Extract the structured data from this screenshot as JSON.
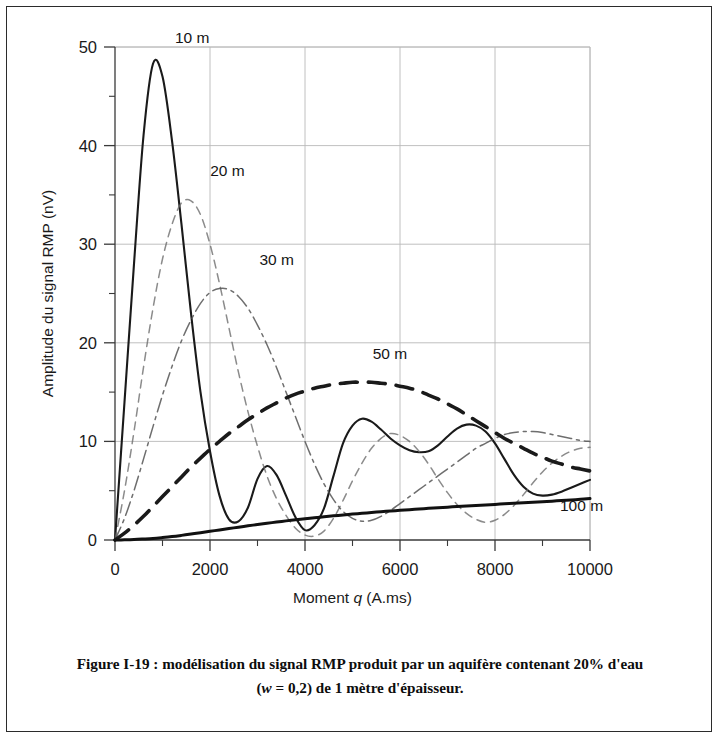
{
  "figure": {
    "caption_line1": "Figure I-19 : modélisation du signal RMP produit par un aquifère contenant 20% d'eau",
    "caption_line2_pre": "(",
    "caption_line2_ital": "w",
    "caption_line2_post": " = 0,2) de 1 mètre d'épaisseur."
  },
  "chart_data": {
    "type": "line",
    "title": "",
    "xlabel_pre": "Moment ",
    "xlabel_ital": "q",
    "xlabel_post": " (A.ms)",
    "xlabel": "Moment q (A.ms)",
    "ylabel": "Amplitude du signal RMP (nV)",
    "xlim": [
      0,
      10000
    ],
    "ylim": [
      0,
      50
    ],
    "grid": true,
    "legend_position": "inline-annotations",
    "x_ticks": [
      0,
      2000,
      4000,
      6000,
      8000,
      10000
    ],
    "x_tick_labels": [
      "0",
      "2000",
      "4000",
      "6000",
      "8000",
      "10000"
    ],
    "x_minor_step": 1000,
    "y_ticks": [
      0,
      10,
      20,
      30,
      40,
      50
    ],
    "y_tick_labels": [
      "0",
      "10",
      "20",
      "30",
      "40",
      "50"
    ],
    "y_minor_step": 5,
    "x": [
      0,
      200,
      400,
      600,
      800,
      1000,
      1200,
      1400,
      1600,
      1800,
      2000,
      2200,
      2400,
      2600,
      2800,
      3000,
      3200,
      3400,
      3600,
      3800,
      4000,
      4200,
      4400,
      4600,
      4800,
      5000,
      5200,
      5400,
      5600,
      5800,
      6000,
      6200,
      6400,
      6600,
      6800,
      7000,
      7200,
      7400,
      7600,
      7800,
      8000,
      8200,
      8400,
      8600,
      8800,
      9000,
      9200,
      9400,
      9600,
      9800,
      10000
    ],
    "series": [
      {
        "name": "10 m",
        "label": "10 m",
        "style": "solid-thin",
        "color": "#1a1a1a",
        "values": [
          0.0,
          14.0,
          28.0,
          41.0,
          48.3,
          47.0,
          40.5,
          32.0,
          23.0,
          15.0,
          9.0,
          4.5,
          2.1,
          1.9,
          3.3,
          6.2,
          7.5,
          6.6,
          4.5,
          2.3,
          1.0,
          1.5,
          3.2,
          6.5,
          9.8,
          11.6,
          12.3,
          12.0,
          11.2,
          10.3,
          9.6,
          9.1,
          8.9,
          9.0,
          9.6,
          10.5,
          11.3,
          11.7,
          11.6,
          11.0,
          9.8,
          8.2,
          6.6,
          5.4,
          4.7,
          4.5,
          4.6,
          4.9,
          5.3,
          5.7,
          6.1
        ]
      },
      {
        "name": "20 m",
        "label": "20 m",
        "style": "dashed-light",
        "color": "#6a6a6a",
        "values": [
          0.0,
          5.0,
          11.0,
          17.5,
          23.5,
          28.5,
          32.0,
          34.2,
          34.4,
          33.0,
          30.0,
          26.0,
          21.5,
          17.0,
          13.0,
          9.5,
          6.5,
          4.2,
          2.5,
          1.2,
          0.5,
          0.4,
          0.9,
          2.2,
          4.0,
          6.0,
          7.8,
          9.3,
          10.3,
          10.8,
          10.6,
          10.0,
          9.0,
          7.7,
          6.2,
          4.8,
          3.6,
          2.7,
          2.1,
          1.8,
          2.0,
          2.6,
          3.5,
          4.6,
          5.8,
          6.9,
          7.8,
          8.5,
          9.0,
          9.3,
          9.4
        ]
      },
      {
        "name": "30 m",
        "label": "30 m",
        "style": "dash-dot",
        "color": "#555555",
        "values": [
          0.0,
          2.2,
          5.0,
          8.2,
          11.5,
          14.7,
          17.6,
          20.2,
          22.3,
          24.0,
          25.1,
          25.5,
          25.4,
          24.7,
          23.5,
          21.8,
          19.8,
          17.5,
          15.0,
          12.5,
          10.0,
          7.7,
          5.7,
          4.1,
          2.9,
          2.2,
          1.9,
          2.0,
          2.4,
          3.0,
          3.7,
          4.4,
          5.1,
          5.8,
          6.5,
          7.2,
          7.9,
          8.6,
          9.3,
          9.8,
          10.3,
          10.7,
          10.9,
          11.0,
          11.0,
          10.9,
          10.7,
          10.5,
          10.3,
          10.1,
          10.0
        ]
      },
      {
        "name": "50 m",
        "label": "50 m",
        "style": "dashed-thick",
        "color": "#1a1a1a",
        "values": [
          0.0,
          0.7,
          1.5,
          2.4,
          3.4,
          4.4,
          5.4,
          6.4,
          7.4,
          8.3,
          9.2,
          10.0,
          10.8,
          11.5,
          12.2,
          12.8,
          13.4,
          13.9,
          14.4,
          14.8,
          15.1,
          15.4,
          15.6,
          15.8,
          15.9,
          16.0,
          16.0,
          16.0,
          15.9,
          15.8,
          15.6,
          15.4,
          15.1,
          14.7,
          14.3,
          13.8,
          13.3,
          12.7,
          12.1,
          11.5,
          10.9,
          10.3,
          9.8,
          9.3,
          8.8,
          8.4,
          8.0,
          7.7,
          7.4,
          7.2,
          7.0
        ]
      },
      {
        "name": "100 m",
        "label": "100 m",
        "style": "solid-thick",
        "color": "#111111",
        "values": [
          0.0,
          0.02,
          0.05,
          0.1,
          0.16,
          0.25,
          0.35,
          0.47,
          0.6,
          0.74,
          0.88,
          1.02,
          1.16,
          1.3,
          1.44,
          1.57,
          1.7,
          1.82,
          1.94,
          2.05,
          2.16,
          2.26,
          2.36,
          2.45,
          2.54,
          2.63,
          2.71,
          2.79,
          2.87,
          2.94,
          3.01,
          3.08,
          3.15,
          3.21,
          3.27,
          3.33,
          3.39,
          3.45,
          3.5,
          3.56,
          3.61,
          3.67,
          3.72,
          3.77,
          3.83,
          3.88,
          3.94,
          4.0,
          4.06,
          4.13,
          4.2
        ]
      }
    ],
    "annotations": [
      {
        "text": "10 m",
        "x": 800,
        "y": 50.0,
        "dx": 22,
        "dy": -4
      },
      {
        "text": "20 m",
        "x": 1500,
        "y": 36.5,
        "dx": 24,
        "dy": -4
      },
      {
        "text": "30 m",
        "x": 2450,
        "y": 27.5,
        "dx": 28,
        "dy": -4
      },
      {
        "text": "50 m",
        "x": 5300,
        "y": 18.0,
        "dx": 6,
        "dy": -4
      },
      {
        "text": "100 m",
        "x": 9200,
        "y": 3.6,
        "dx": 8,
        "dy": 6
      }
    ]
  }
}
